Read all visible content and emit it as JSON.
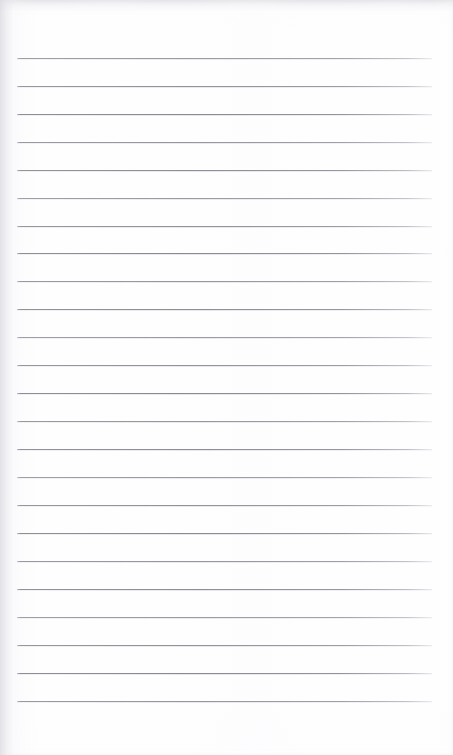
{
  "document": {
    "kind": "ruled-notepaper-scan",
    "title": "Ruled notepaper page",
    "page_width": 453,
    "page_height": 755,
    "background_color": "#fefeff",
    "paper_tone_color": "#f4f4f7",
    "text_content": "",
    "handwriting_present": false,
    "printed_text_present": false
  },
  "ruling": {
    "line_color": "#8a8a92",
    "line_thickness": 1,
    "line_count": 24,
    "line_left_x": 17,
    "line_right_x": 432,
    "line_length": 415,
    "first_line_y": 58,
    "line_spacing": 27.95,
    "margin_left": 17,
    "margin_right": 21,
    "margin_top": 58,
    "margin_bottom": 54,
    "vertical_margin_rule": false,
    "line_positions": [
      58,
      86,
      114,
      142,
      170,
      198,
      226,
      253,
      281,
      309,
      337,
      365,
      393,
      421,
      449,
      477,
      505,
      533,
      561,
      589,
      617,
      645,
      673,
      701
    ]
  },
  "labels": {
    "page_region": "notepaper-page",
    "rule_region": "ruled-lines-area",
    "writing_area": "writing-area",
    "top_margin": "top-margin",
    "bottom_margin": "bottom-margin"
  }
}
